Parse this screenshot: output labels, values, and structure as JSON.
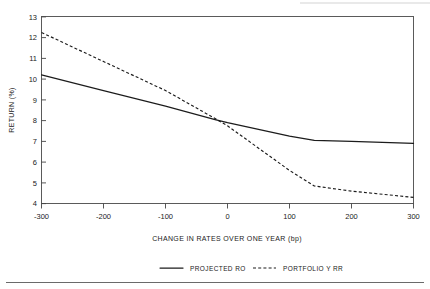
{
  "chart_data": {
    "type": "line",
    "title": "",
    "xlabel": "CHANGE IN RATES OVER ONE YEAR (bp)",
    "ylabel": "RETURN (%)",
    "xlim": [
      -300,
      300
    ],
    "ylim": [
      4,
      13
    ],
    "xticks": [
      -300,
      -200,
      -100,
      0,
      100,
      200,
      300
    ],
    "xtick_labels": [
      "-300",
      "-200",
      "-100",
      "0",
      "100",
      "200",
      "300"
    ],
    "yticks": [
      4,
      5,
      6,
      7,
      8,
      9,
      10,
      11,
      12,
      13
    ],
    "ytick_labels": [
      "4",
      "5",
      "6",
      "7",
      "8",
      "9",
      "10",
      "11",
      "12",
      "13"
    ],
    "grid": false,
    "legend_position": "below-plot",
    "series": [
      {
        "name": "PROJECTED RO",
        "style": "solid",
        "color": "#1c1c1c",
        "x": [
          -300,
          -200,
          -100,
          -20,
          0,
          100,
          140,
          200,
          300
        ],
        "values": [
          10.2,
          9.45,
          8.7,
          8.05,
          7.9,
          7.25,
          7.05,
          7.0,
          6.9
        ]
      },
      {
        "name": "PORTFOLIO Y RR",
        "style": "dashed",
        "color": "#1c1c1c",
        "x": [
          -300,
          -200,
          -100,
          -20,
          0,
          100,
          140,
          200,
          300
        ],
        "values": [
          12.25,
          10.85,
          9.45,
          8.1,
          7.75,
          5.6,
          4.85,
          4.6,
          4.3
        ]
      }
    ]
  },
  "axes": {
    "ylabel": "RETURN (%)",
    "xlabel": "CHANGE IN RATES OVER ONE YEAR (bp)"
  },
  "legend": {
    "entries": [
      {
        "label": "PROJECTED RO",
        "style": "solid"
      },
      {
        "label": "PORTFOLIO Y RR",
        "style": "dashed"
      }
    ]
  }
}
